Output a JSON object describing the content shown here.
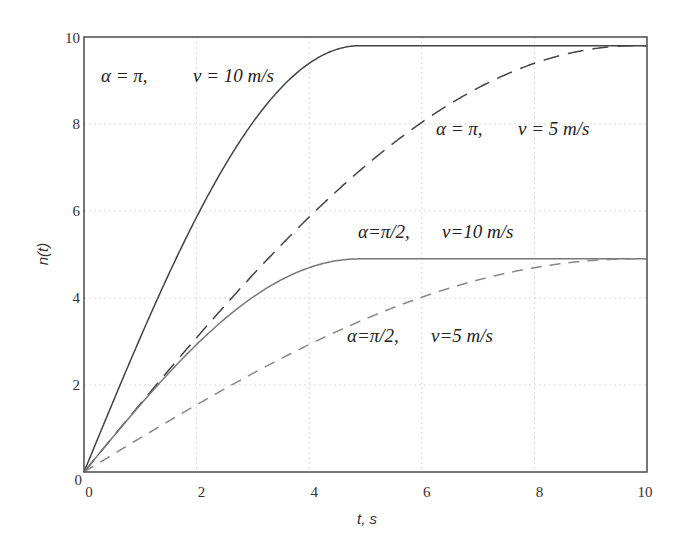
{
  "chart_data": {
    "type": "line",
    "title": "",
    "xlabel": "t, s",
    "ylabel": "n(t)",
    "xlim": [
      0,
      10
    ],
    "ylim": [
      0,
      10
    ],
    "x_ticks": [
      "0",
      "2",
      "4",
      "6",
      "8",
      "10"
    ],
    "y_ticks": [
      "0",
      "2",
      "4",
      "6",
      "8",
      "10"
    ],
    "grid": true,
    "legend": "inline annotations",
    "x": [
      0,
      0.5,
      1,
      1.5,
      2,
      2.5,
      3,
      3.5,
      4,
      4.5,
      4.9,
      5,
      5.5,
      6,
      6.5,
      7,
      7.5,
      8,
      8.5,
      9,
      9.5,
      9.8,
      10
    ],
    "series": [
      {
        "name": "α=π, v=10 m/s",
        "style": "solid",
        "color": "#444444",
        "plateau": 9.8,
        "rise_time": 4.9,
        "values": [
          0,
          1.56,
          3.07,
          4.5,
          5.8,
          6.94,
          7.9,
          8.66,
          9.23,
          9.6,
          9.8,
          9.8,
          9.8,
          9.8,
          9.8,
          9.8,
          9.8,
          9.8,
          9.8,
          9.8,
          9.8,
          9.8,
          9.8
        ]
      },
      {
        "name": "α=π, v=5 m/s",
        "style": "long-dash",
        "color": "#444444",
        "plateau": 9.8,
        "rise_time": 9.8,
        "values": [
          0,
          0.78,
          1.56,
          2.32,
          3.07,
          3.8,
          4.5,
          5.17,
          5.8,
          6.39,
          6.93,
          7.0,
          7.47,
          7.9,
          8.31,
          8.66,
          8.97,
          9.23,
          9.44,
          9.6,
          9.72,
          9.8,
          9.8
        ]
      },
      {
        "name": "α=π/2, v=10 m/s",
        "style": "solid",
        "color": "#777777",
        "plateau": 4.9,
        "rise_time": 4.9,
        "values": [
          0,
          0.78,
          1.53,
          2.25,
          2.9,
          3.47,
          3.95,
          4.33,
          4.61,
          4.8,
          4.9,
          4.9,
          4.9,
          4.9,
          4.9,
          4.9,
          4.9,
          4.9,
          4.9,
          4.9,
          4.9,
          4.9,
          4.9
        ]
      },
      {
        "name": "α=π/2, v=5 m/s",
        "style": "dash",
        "color": "#888888",
        "plateau": 4.9,
        "rise_time": 9.8,
        "values": [
          0,
          0.39,
          0.78,
          1.16,
          1.53,
          1.9,
          2.25,
          2.58,
          2.9,
          3.19,
          3.46,
          3.5,
          3.73,
          3.95,
          4.15,
          4.33,
          4.48,
          4.61,
          4.72,
          4.8,
          4.86,
          4.9,
          4.9
        ]
      }
    ],
    "annotations": [
      {
        "text_alpha": "α = π,",
        "text_v": "v = 10 m/s",
        "x": 0.3,
        "y": 9.1
      },
      {
        "text_alpha": "α = π,",
        "text_v": "v = 5 m/s",
        "x": 6.3,
        "y": 7.9
      },
      {
        "text_alpha": "α=π/2,",
        "text_v": "v=10 m/s",
        "x": 4.4,
        "y": 5.9
      },
      {
        "text_alpha": "α=π/2,",
        "text_v": "v=5 m/s",
        "x": 4.9,
        "y": 3.5
      }
    ]
  },
  "axes": {
    "x_label": "t, s",
    "y_label": "n(t)",
    "y_origin_label": "0",
    "x_origin_label": "0"
  },
  "colors": {
    "frame": "#555555",
    "grid": "#d9d9d9",
    "text": "#333333"
  }
}
